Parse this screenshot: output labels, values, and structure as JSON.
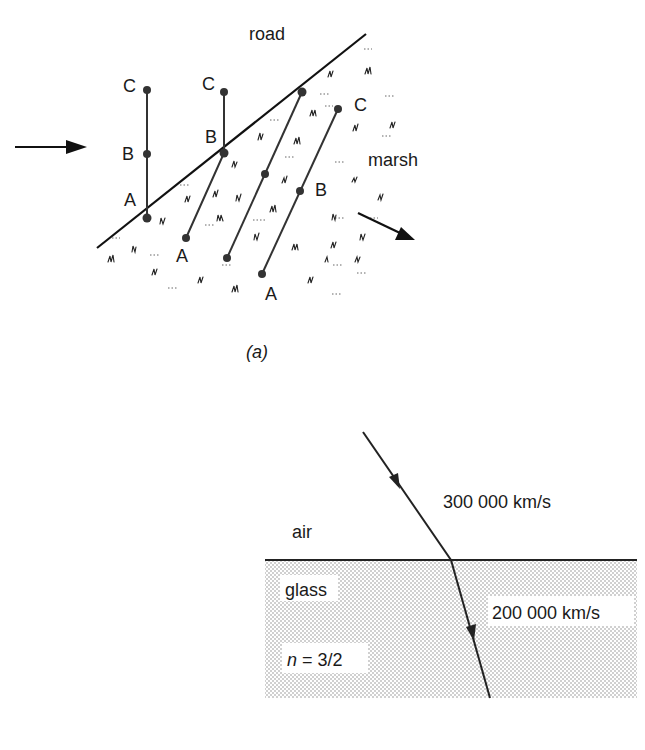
{
  "figure_a": {
    "caption": "(a)",
    "labels": {
      "road": "road",
      "marsh": "marsh"
    },
    "columns": [
      {
        "name": "column-1",
        "points": [
          {
            "label": "C",
            "x": 147,
            "y": 90,
            "lx": 124,
            "ly": 92
          },
          {
            "label": "B",
            "x": 147,
            "y": 154,
            "lx": 123,
            "ly": 158
          },
          {
            "label": "A",
            "x": 147,
            "y": 218,
            "lx": 124,
            "ly": 205
          }
        ]
      },
      {
        "name": "column-2",
        "points": [
          {
            "label": "C",
            "x": 224,
            "y": 92,
            "lx": 203,
            "ly": 89
          },
          {
            "label": "B",
            "x": 224,
            "y": 153,
            "lx": 206,
            "ly": 142
          },
          {
            "label": "A",
            "x": 186,
            "y": 238,
            "lx": 177,
            "ly": 262
          }
        ]
      },
      {
        "name": "column-3",
        "points": [
          {
            "label": "",
            "x": 302,
            "y": 92
          },
          {
            "label": "",
            "x": 265,
            "y": 174
          },
          {
            "label": "",
            "x": 227,
            "y": 258
          }
        ]
      },
      {
        "name": "column-4",
        "points": [
          {
            "label": "C",
            "x": 338,
            "y": 109,
            "lx": 354,
            "ly": 110
          },
          {
            "label": "B",
            "x": 300,
            "y": 191,
            "lx": 315,
            "ly": 195
          },
          {
            "label": "A",
            "x": 262,
            "y": 274,
            "lx": 266,
            "ly": 300
          }
        ]
      }
    ],
    "road_line": {
      "x1": 97,
      "y1": 248,
      "x2": 366,
      "y2": 34
    },
    "incoming_arrow": {
      "x1": 15,
      "y1": 147,
      "x2": 87,
      "y2": 147
    },
    "outgoing_arrow": {
      "x1": 358,
      "y1": 213,
      "x2": 415,
      "y2": 240
    }
  },
  "figure_b": {
    "air_label": "air",
    "glass_label": "glass",
    "speed_air": "300 000 km/s",
    "speed_glass": "200 000 km/s",
    "index_var": "n",
    "index_value": " = 3/2",
    "interface": {
      "x1": 265,
      "x2": 637,
      "y": 560
    },
    "glass_box": {
      "x": 265,
      "y": 560,
      "width": 372,
      "height": 138
    },
    "incident_ray": {
      "x1": 363,
      "y1": 432,
      "x2": 451,
      "y2": 560
    },
    "refracted_ray": {
      "x1": 451,
      "y1": 560,
      "x2": 490,
      "y2": 698
    }
  }
}
